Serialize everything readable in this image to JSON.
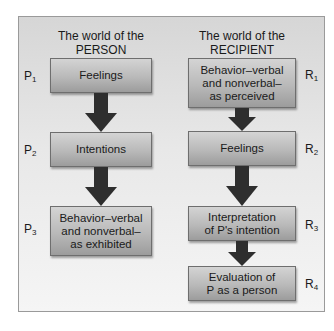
{
  "person": {
    "title_line1": "The world of the",
    "title_line2": "PERSON",
    "steps": [
      {
        "label": "P",
        "sub": "1",
        "lines": [
          "Feelings"
        ]
      },
      {
        "label": "P",
        "sub": "2",
        "lines": [
          "Intentions"
        ]
      },
      {
        "label": "P",
        "sub": "3",
        "lines": [
          "Behavior–verbal",
          "and nonverbal–",
          "as exhibited"
        ]
      }
    ]
  },
  "recipient": {
    "title_line1": "The world of the",
    "title_line2": "RECIPIENT",
    "steps": [
      {
        "label": "R",
        "sub": "1",
        "lines": [
          "Behavior–verbal",
          "and nonverbal–",
          "as perceived"
        ]
      },
      {
        "label": "R",
        "sub": "2",
        "lines": [
          "Feelings"
        ]
      },
      {
        "label": "R",
        "sub": "3",
        "lines": [
          "Interpretation",
          "of P's intention"
        ]
      },
      {
        "label": "R",
        "sub": "4",
        "lines": [
          "Evaluation of",
          "P as a person"
        ]
      }
    ]
  },
  "colors": {
    "arrow": "#2e2e2e",
    "box_top": "#d4d4d4",
    "box_bottom": "#9c9c9c",
    "panel_top": "#d6d6d6",
    "panel_bottom": "#f5f5f5"
  }
}
